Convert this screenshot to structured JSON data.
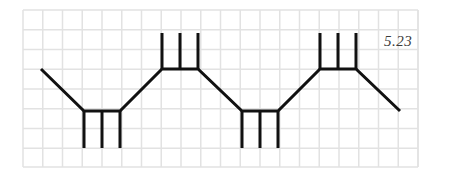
{
  "figure": {
    "label": "5.23",
    "grid": {
      "x0": 23,
      "y0": 10,
      "x1": 418,
      "y1": 167,
      "spacing": 19.75,
      "color": "#e2e2e2"
    },
    "stroke": {
      "color": "#111111",
      "width": 3
    },
    "path": {
      "points": [
        [
          41,
          69
        ],
        [
          84,
          111
        ],
        [
          120,
          111
        ],
        [
          162,
          69
        ],
        [
          198,
          69
        ],
        [
          242,
          111
        ],
        [
          278,
          111
        ],
        [
          320,
          69
        ],
        [
          356,
          69
        ],
        [
          400,
          111
        ]
      ]
    },
    "prongs": {
      "down": [
        {
          "x": 84,
          "y0": 111,
          "y1": 148
        },
        {
          "x": 102,
          "y0": 111,
          "y1": 148
        },
        {
          "x": 120,
          "y0": 111,
          "y1": 148
        },
        {
          "x": 242,
          "y0": 111,
          "y1": 148
        },
        {
          "x": 260,
          "y0": 111,
          "y1": 148
        },
        {
          "x": 278,
          "y0": 111,
          "y1": 148
        }
      ],
      "up": [
        {
          "x": 162,
          "y0": 69,
          "y1": 33
        },
        {
          "x": 180,
          "y0": 69,
          "y1": 33
        },
        {
          "x": 198,
          "y0": 69,
          "y1": 33
        },
        {
          "x": 320,
          "y0": 69,
          "y1": 33
        },
        {
          "x": 338,
          "y0": 69,
          "y1": 33
        },
        {
          "x": 356,
          "y0": 69,
          "y1": 33
        }
      ]
    }
  }
}
